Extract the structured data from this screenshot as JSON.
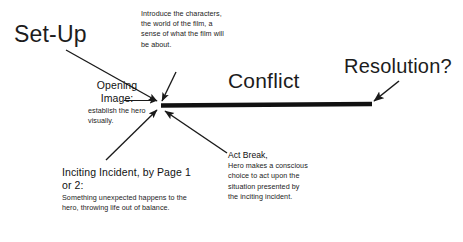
{
  "diagram": {
    "background_color": "#ffffff",
    "ink_color": "#1a1a1a",
    "headings": {
      "setup": "Set-Up",
      "conflict": "Conflict",
      "resolution": "Resolution?"
    },
    "notes": {
      "introduce": "Introduce the characters, the world of the film, a sense of what the film will be about.",
      "opening_image_title": "Opening Image:",
      "opening_image_body": "establish the hero visually.",
      "inciting_title": "Inciting Incident, by Page 1 or 2:",
      "inciting_body": "Something unexpected happens to the hero, throwing life out of balance.",
      "act_break_title": "Act Break,",
      "act_break_body": "Hero makes a conscious choice to act upon the situation presented by the inciting incident."
    }
  }
}
